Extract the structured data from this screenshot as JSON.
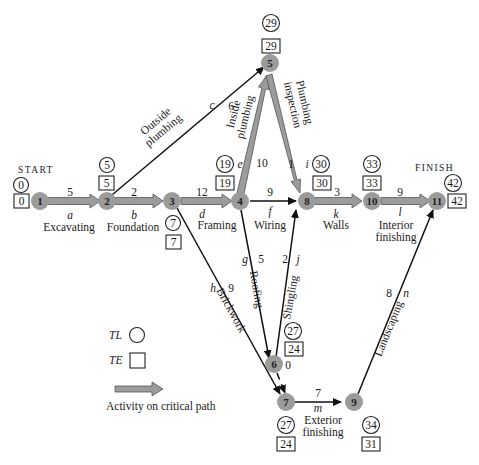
{
  "labels": {
    "start": "START",
    "finish": "FINISH",
    "legend_tl": "TL",
    "legend_te": "TE",
    "legend_critical": "Activity on critical path"
  },
  "nodes": [
    {
      "id": "1",
      "tl": "0",
      "te": "0"
    },
    {
      "id": "2",
      "tl": "5",
      "te": "5"
    },
    {
      "id": "3",
      "tl": "7",
      "te": "7"
    },
    {
      "id": "4",
      "tl": "19",
      "te": "19"
    },
    {
      "id": "5",
      "tl": "29",
      "te": "29"
    },
    {
      "id": "6",
      "tl": "27",
      "te": "24"
    },
    {
      "id": "7",
      "tl": "27",
      "te": "24"
    },
    {
      "id": "8",
      "tl": "30",
      "te": "30"
    },
    {
      "id": "9",
      "tl": "34",
      "te": "31"
    },
    {
      "id": "10",
      "tl": "33",
      "te": "33"
    },
    {
      "id": "11",
      "tl": "42",
      "te": "42"
    }
  ],
  "activities": [
    {
      "letter": "a",
      "name": "Excavating",
      "duration": "5",
      "from": "1",
      "to": "2",
      "critical": true
    },
    {
      "letter": "b",
      "name": "Foundation",
      "duration": "2",
      "from": "2",
      "to": "3",
      "critical": true
    },
    {
      "letter": "c",
      "name": "Outside plumbing",
      "name_l1": "Outside",
      "name_l2": "plumbing",
      "duration": "6",
      "from": "2",
      "to": "5",
      "critical": false
    },
    {
      "letter": "d",
      "name": "Framing",
      "duration": "12",
      "from": "3",
      "to": "4",
      "critical": true
    },
    {
      "letter": "e",
      "name": "Inside plumbing",
      "name_l1": "Inside",
      "name_l2": "plumbing",
      "duration": "10",
      "from": "4",
      "to": "5",
      "critical": true
    },
    {
      "letter": "f",
      "name": "Wiring",
      "duration": "9",
      "from": "4",
      "to": "8",
      "critical": false
    },
    {
      "letter": "g",
      "name": "Roofing",
      "duration": "5",
      "from": "4",
      "to": "6",
      "critical": false
    },
    {
      "letter": "h",
      "name": "Brickwork",
      "duration": "9",
      "from": "3",
      "to": "7",
      "critical": false
    },
    {
      "letter": "i",
      "name": "Plumbing inspection",
      "name_l1": "Plumbing",
      "name_l2": "inspection",
      "duration": "1",
      "from": "5",
      "to": "8",
      "critical": true
    },
    {
      "letter": "j",
      "name": "Shingling",
      "duration": "2",
      "from": "6",
      "to": "8",
      "critical": false
    },
    {
      "letter": "k",
      "name": "Walls",
      "duration": "3",
      "from": "8",
      "to": "10",
      "critical": true
    },
    {
      "letter": "l",
      "name": "Interior finishing",
      "name_l1": "Interior",
      "name_l2": "finishing",
      "duration": "9",
      "from": "10",
      "to": "11",
      "critical": true
    },
    {
      "letter": "m",
      "name": "Exterior finishing",
      "name_l1": "Exterior",
      "name_l2": "finishing",
      "duration": "7",
      "from": "7",
      "to": "9",
      "critical": false
    },
    {
      "letter": "n",
      "name": "Landscaping",
      "duration": "8",
      "from": "9",
      "to": "11",
      "critical": false
    },
    {
      "letter": "",
      "name": "Dummy",
      "duration": "0",
      "from": "6",
      "to": "7",
      "critical": false,
      "dummy": true
    }
  ],
  "colors": {
    "node_fill": "#9b9b9b",
    "critical_arrow": "#9c9c9c",
    "line": "#111111"
  }
}
